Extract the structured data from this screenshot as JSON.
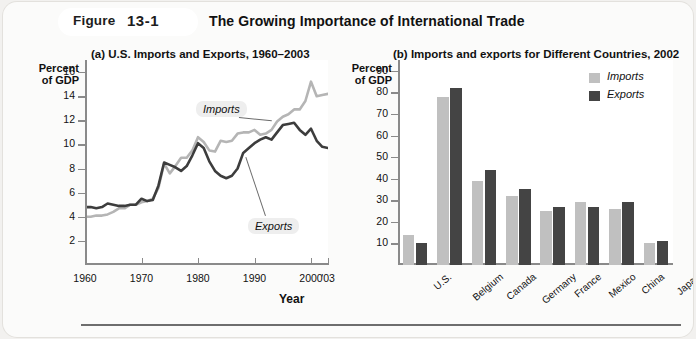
{
  "figure": {
    "label": "Figure",
    "number": "13-1",
    "title": "The Growing Importance of International Trade"
  },
  "colors": {
    "imports": "#c0c0c0",
    "exports": "#444444",
    "axis": "#8a8a8a",
    "page_background": "#fbfbfa",
    "plot_background": "#ffffff"
  },
  "panel_a": {
    "title": "(a) U.S. Imports and Exports, 1960–2003",
    "y_axis_caption_line1": "Percent",
    "y_axis_caption_line2": "of GDP",
    "x_axis_label": "Year",
    "callout_imports": "Imports",
    "callout_exports": "Exports"
  },
  "panel_b": {
    "title": "(b) Imports and exports for Different Countries, 2002",
    "y_axis_caption_line1": "Percent",
    "y_axis_caption_line2": "of GDP",
    "legend": [
      {
        "label": "Imports",
        "color": "#c0c0c0"
      },
      {
        "label": "Exports",
        "color": "#444444"
      }
    ]
  },
  "chart_data": [
    {
      "type": "line",
      "title": "(a) U.S. Imports and Exports, 1960–2003",
      "xlabel": "Year",
      "ylabel": "Percent of GDP",
      "xlim": [
        1960,
        2003
      ],
      "ylim": [
        0,
        17
      ],
      "grid": false,
      "ytick_labels": [
        "2",
        "4",
        "6",
        "8",
        "10",
        "12",
        "14",
        "16"
      ],
      "yticks": [
        2,
        4,
        6,
        8,
        10,
        12,
        14,
        16
      ],
      "xtick_labels": [
        "1960",
        "1970",
        "1980",
        "1990",
        "2000",
        "'03"
      ],
      "xticks": [
        1960,
        1970,
        1980,
        1990,
        2000,
        2003
      ],
      "x": [
        1960,
        1961,
        1962,
        1963,
        1964,
        1965,
        1966,
        1967,
        1968,
        1969,
        1970,
        1971,
        1972,
        1973,
        1974,
        1975,
        1976,
        1977,
        1978,
        1979,
        1980,
        1981,
        1982,
        1983,
        1984,
        1985,
        1986,
        1987,
        1988,
        1989,
        1990,
        1991,
        1992,
        1993,
        1994,
        1995,
        1996,
        1997,
        1998,
        1999,
        2000,
        2001,
        2002,
        2003
      ],
      "series": [
        {
          "name": "Imports",
          "color": "#b5b5b5",
          "values": [
            4.0,
            4.0,
            4.1,
            4.1,
            4.2,
            4.4,
            4.7,
            4.7,
            5.0,
            5.0,
            5.2,
            5.3,
            5.5,
            6.4,
            8.4,
            7.6,
            8.2,
            8.9,
            8.9,
            9.5,
            10.6,
            10.2,
            9.5,
            9.4,
            10.3,
            10.2,
            10.3,
            10.9,
            11.0,
            11.0,
            11.2,
            10.8,
            10.9,
            11.2,
            11.9,
            12.3,
            12.5,
            12.9,
            12.9,
            13.6,
            15.2,
            14.0,
            14.1,
            14.2
          ]
        },
        {
          "name": "Exports",
          "color": "#3d3d3d",
          "values": [
            4.8,
            4.8,
            4.7,
            4.8,
            5.1,
            5.0,
            4.9,
            4.9,
            5.0,
            5.0,
            5.5,
            5.3,
            5.4,
            6.6,
            8.5,
            8.3,
            8.1,
            7.8,
            8.2,
            9.1,
            10.1,
            9.7,
            8.6,
            7.8,
            7.4,
            7.2,
            7.4,
            8.0,
            9.3,
            9.7,
            10.1,
            10.4,
            10.6,
            10.4,
            11.0,
            11.6,
            11.7,
            11.8,
            11.2,
            10.8,
            11.3,
            10.3,
            9.8,
            9.7
          ]
        }
      ],
      "annotations": [
        {
          "text": "Imports",
          "points_to_year": 1993,
          "points_to_value": 12.0
        },
        {
          "text": "Exports",
          "points_to_year": 1988,
          "points_to_value": 9.3
        }
      ]
    },
    {
      "type": "bar",
      "title": "(b) Imports and exports for Different Countries, 2002",
      "xlabel": "",
      "ylabel": "Percent of GDP",
      "ylim": [
        0,
        95
      ],
      "grid": false,
      "ytick_labels": [
        "10",
        "20",
        "30",
        "40",
        "50",
        "60",
        "70",
        "80",
        "90"
      ],
      "yticks": [
        10,
        20,
        30,
        40,
        50,
        60,
        70,
        80,
        90
      ],
      "categories": [
        "U.S.",
        "Belgium",
        "Canada",
        "Germany",
        "France",
        "Mexico",
        "China",
        "Japan"
      ],
      "legend_position": "top-right",
      "series": [
        {
          "name": "Imports",
          "color": "#c0c0c0",
          "values": [
            14,
            78,
            39,
            32,
            25,
            29,
            26,
            10
          ]
        },
        {
          "name": "Exports",
          "color": "#444444",
          "values": [
            10,
            82,
            44,
            35,
            27,
            27,
            29,
            11
          ]
        }
      ]
    }
  ]
}
